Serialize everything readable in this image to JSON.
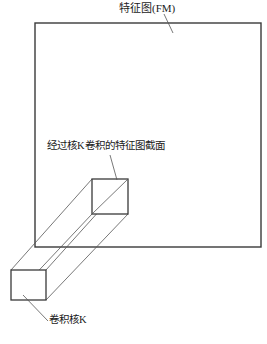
{
  "figure": {
    "type": "diagram",
    "background_color": "#ffffff",
    "stroke_color": "#3a3a3a",
    "thin_stroke_color": "#555555",
    "labels": {
      "feature_map": "特征图(FM)",
      "conv_section": "经过核K卷积的特征图截面",
      "kernel": "卷积核K"
    },
    "caption_partial": "",
    "shapes": {
      "feature_map_rect": {
        "x": 35,
        "y": 23,
        "width": 226,
        "height": 224
      },
      "section_square": {
        "x": 92,
        "y": 179,
        "width": 36,
        "height": 35
      },
      "kernel_square": {
        "x": 11,
        "y": 270,
        "width": 35,
        "height": 30
      }
    },
    "leaders": [
      {
        "name": "feature-map-leader",
        "x1": 164,
        "y1": 14,
        "x2": 173,
        "y2": 33
      },
      {
        "name": "section-leader",
        "x1": 110,
        "y1": 155,
        "x2": 117,
        "y2": 180
      },
      {
        "name": "kernel-leader",
        "x1": 23,
        "y1": 295,
        "x2": 48,
        "y2": 321
      }
    ]
  }
}
